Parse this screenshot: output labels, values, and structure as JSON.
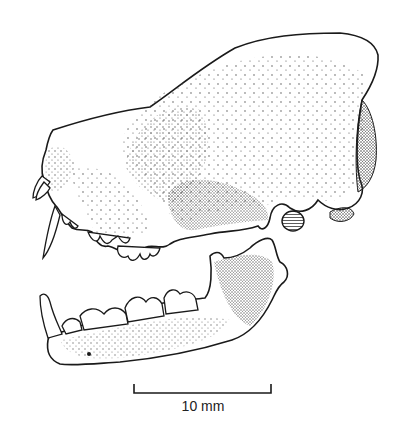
{
  "figure": {
    "ink_color": "#1a1a1a",
    "background": "#ffffff"
  },
  "scale_bar": {
    "label": "10 mm",
    "length_mm": 10
  }
}
